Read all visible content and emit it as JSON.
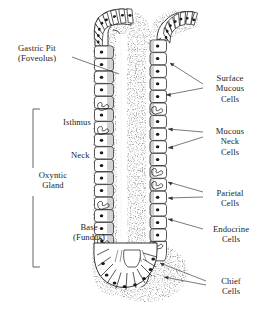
{
  "figure": {
    "style": "black-and-white line drawing",
    "background_color": "#ffffff",
    "ink_color": "#1a1a1a"
  },
  "labels": {
    "left": [
      {
        "id": "gastric-pit",
        "line1": "Gastric Pit",
        "line2": "(Foveolus)"
      },
      {
        "id": "isthmus",
        "line1": "Isthmus",
        "line2": ""
      },
      {
        "id": "neck",
        "line1": "Neck",
        "line2": ""
      },
      {
        "id": "oxyntic-gland",
        "line1": "Oxyntic",
        "line2": "Gland"
      },
      {
        "id": "base",
        "line1": "Base",
        "line2": "(Fundus)"
      }
    ],
    "right": [
      {
        "id": "surface-mucous-cells",
        "line1": "Surface",
        "line2": "Mucous",
        "line3": "Cells"
      },
      {
        "id": "mucous-neck-cells",
        "line1": "Mucous",
        "line2": "Neck",
        "line3": "Cells"
      },
      {
        "id": "parietal-cells",
        "line1": "Parietal",
        "line2": "Cells",
        "line3": ""
      },
      {
        "id": "endocrine-cells",
        "line1": "Endocrine",
        "line2": "Cells",
        "line3": ""
      },
      {
        "id": "chief-cells",
        "line1": "Chief",
        "line2": "Cells",
        "line3": ""
      }
    ]
  }
}
